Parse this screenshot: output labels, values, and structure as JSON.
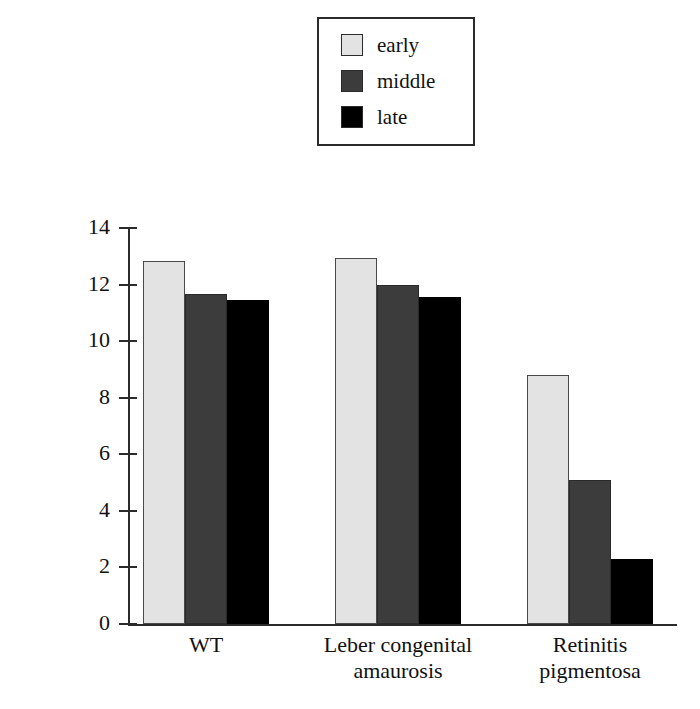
{
  "chart_data": {
    "type": "bar",
    "title": "",
    "xlabel": "",
    "ylabel": "Number of photoreceptor rows",
    "ylim": [
      0,
      14
    ],
    "yticks": [
      0,
      2,
      4,
      6,
      8,
      10,
      12,
      14
    ],
    "grid": false,
    "legend_position": "top-center",
    "categories": [
      "WT",
      "Leber congenital\namaurosis",
      "Retinitis\npigmentosa"
    ],
    "series": [
      {
        "name": "early",
        "color": "#e3e3e3",
        "values": [
          12.85,
          12.95,
          8.8
        ]
      },
      {
        "name": "middle",
        "color": "#3c3c3c",
        "values": [
          11.65,
          12.0,
          5.1
        ]
      },
      {
        "name": "late",
        "color": "#000000",
        "values": [
          11.45,
          11.55,
          2.3
        ]
      }
    ]
  },
  "legend": {
    "items": [
      {
        "label": "early",
        "color": "#e3e3e3"
      },
      {
        "label": "middle",
        "color": "#3c3c3c"
      },
      {
        "label": "late",
        "color": "#000000"
      }
    ]
  },
  "axis": {
    "y_title": "Number of photoreceptor rows",
    "y_ticks": [
      "0",
      "2",
      "4",
      "6",
      "8",
      "10",
      "12",
      "14"
    ],
    "x_categories": [
      "WT",
      "Leber congenital\namaurosis",
      "Retinitis\npigmentosa"
    ]
  }
}
